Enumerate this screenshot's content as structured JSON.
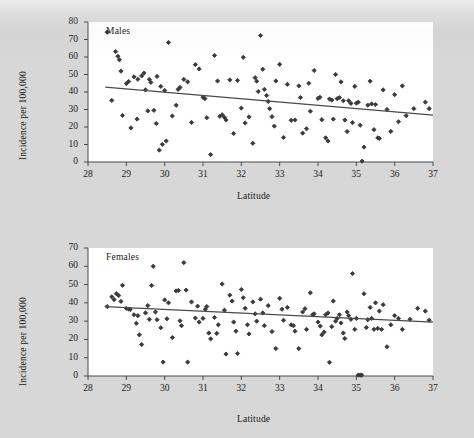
{
  "figure": {
    "background_color": "#d7d7d7",
    "plot_background_color": "#ffffff",
    "marker_color": "#3a3a3a",
    "line_color": "#4a4a4a",
    "axis_color": "#4a4a4a"
  },
  "chart_data": [
    {
      "type": "scatter",
      "title": "Males",
      "xlabel": "Latitude",
      "ylabel": "Incidence per 100,000",
      "xlim": [
        28,
        37
      ],
      "ylim": [
        0,
        80
      ],
      "xticks": [
        28,
        29,
        30,
        31,
        32,
        33,
        34,
        35,
        36,
        37
      ],
      "yticks": [
        0,
        10,
        20,
        30,
        40,
        50,
        60,
        70,
        80
      ],
      "grid": false,
      "legend": "none",
      "marker": "diamond",
      "trendline": {
        "x": [
          28.45,
          37.0
        ],
        "y": [
          42.8,
          26.8
        ],
        "label": "linear fit"
      },
      "points": [
        [
          28.5,
          74.2
        ],
        [
          28.62,
          35.2
        ],
        [
          28.72,
          63.1
        ],
        [
          28.78,
          60.4
        ],
        [
          28.82,
          58.4
        ],
        [
          28.86,
          51.9
        ],
        [
          28.9,
          26.6
        ],
        [
          29.0,
          44.8
        ],
        [
          29.06,
          46.0
        ],
        [
          29.12,
          19.5
        ],
        [
          29.2,
          48.7
        ],
        [
          29.28,
          24.5
        ],
        [
          29.3,
          47.3
        ],
        [
          29.4,
          49.2
        ],
        [
          29.46,
          50.8
        ],
        [
          29.5,
          41.2
        ],
        [
          29.56,
          29.2
        ],
        [
          29.6,
          47.2
        ],
        [
          29.64,
          45.5
        ],
        [
          29.72,
          29.5
        ],
        [
          29.78,
          22.0
        ],
        [
          29.8,
          48.9
        ],
        [
          29.86,
          6.8
        ],
        [
          29.9,
          43.2
        ],
        [
          29.94,
          10.1
        ],
        [
          30.0,
          40.9
        ],
        [
          30.04,
          12.0
        ],
        [
          30.1,
          68.3
        ],
        [
          30.2,
          26.3
        ],
        [
          30.3,
          32.4
        ],
        [
          30.35,
          41.5
        ],
        [
          30.4,
          42.6
        ],
        [
          30.5,
          47.2
        ],
        [
          30.6,
          45.8
        ],
        [
          30.7,
          22.6
        ],
        [
          30.8,
          55.6
        ],
        [
          30.9,
          53.2
        ],
        [
          31.0,
          37.0
        ],
        [
          31.05,
          36.2
        ],
        [
          31.1,
          25.3
        ],
        [
          31.2,
          4.2
        ],
        [
          31.3,
          60.9
        ],
        [
          31.38,
          46.3
        ],
        [
          31.44,
          26.1
        ],
        [
          31.5,
          27.0
        ],
        [
          31.56,
          25.5
        ],
        [
          31.6,
          24.0
        ],
        [
          31.7,
          46.9
        ],
        [
          31.8,
          16.3
        ],
        [
          31.9,
          46.6
        ],
        [
          32.0,
          30.8
        ],
        [
          32.05,
          59.8
        ],
        [
          32.1,
          22.3
        ],
        [
          32.2,
          25.8
        ],
        [
          32.3,
          10.7
        ],
        [
          32.36,
          48.2
        ],
        [
          32.4,
          46.2
        ],
        [
          32.44,
          40.3
        ],
        [
          32.5,
          72.3
        ],
        [
          32.56,
          53.0
        ],
        [
          32.6,
          41.5
        ],
        [
          32.66,
          38.0
        ],
        [
          32.7,
          34.6
        ],
        [
          32.74,
          30.5
        ],
        [
          32.8,
          25.9
        ],
        [
          32.86,
          20.5
        ],
        [
          32.9,
          46.3
        ],
        [
          33.0,
          55.8
        ],
        [
          33.1,
          14.0
        ],
        [
          33.2,
          44.4
        ],
        [
          33.3,
          23.8
        ],
        [
          33.4,
          24.0
        ],
        [
          33.5,
          43.5
        ],
        [
          33.54,
          36.8
        ],
        [
          33.6,
          16.5
        ],
        [
          33.7,
          19.0
        ],
        [
          33.76,
          45.0
        ],
        [
          33.8,
          29.0
        ],
        [
          33.9,
          52.3
        ],
        [
          34.0,
          36.3
        ],
        [
          34.05,
          37.0
        ],
        [
          34.1,
          24.2
        ],
        [
          34.2,
          13.8
        ],
        [
          34.26,
          12.0
        ],
        [
          34.3,
          36.0
        ],
        [
          34.36,
          35.4
        ],
        [
          34.4,
          24.5
        ],
        [
          34.46,
          50.0
        ],
        [
          34.5,
          36.2
        ],
        [
          34.56,
          36.8
        ],
        [
          34.6,
          45.8
        ],
        [
          34.66,
          35.0
        ],
        [
          34.7,
          24.0
        ],
        [
          34.76,
          17.4
        ],
        [
          34.8,
          35.0
        ],
        [
          34.86,
          33.5
        ],
        [
          34.9,
          22.5
        ],
        [
          34.96,
          43.2
        ],
        [
          35.0,
          33.6
        ],
        [
          35.05,
          34.2
        ],
        [
          35.1,
          21.0
        ],
        [
          35.15,
          0.5
        ],
        [
          35.2,
          8.5
        ],
        [
          35.3,
          32.5
        ],
        [
          35.36,
          46.2
        ],
        [
          35.4,
          33.2
        ],
        [
          35.46,
          18.5
        ],
        [
          35.5,
          32.8
        ],
        [
          35.56,
          13.8
        ],
        [
          35.6,
          13.5
        ],
        [
          35.7,
          41.2
        ],
        [
          35.8,
          30.0
        ],
        [
          35.9,
          17.5
        ],
        [
          36.0,
          38.5
        ],
        [
          36.1,
          23.0
        ],
        [
          36.2,
          43.5
        ],
        [
          36.3,
          26.5
        ],
        [
          36.5,
          30.5
        ],
        [
          36.8,
          34.2
        ],
        [
          36.9,
          30.5
        ]
      ]
    },
    {
      "type": "scatter",
      "title": "Females",
      "xlabel": "Latitude",
      "ylabel": "Incidence per 100,000",
      "xlim": [
        28,
        37
      ],
      "ylim": [
        0,
        70
      ],
      "xticks": [
        28,
        29,
        30,
        31,
        32,
        33,
        34,
        35,
        36,
        37
      ],
      "yticks": [
        0,
        10,
        20,
        30,
        40,
        50,
        60,
        70
      ],
      "grid": false,
      "legend": "none",
      "marker": "diamond",
      "trendline": {
        "x": [
          28.45,
          37.0
        ],
        "y": [
          37.9,
          29.5
        ],
        "label": "linear fit"
      },
      "points": [
        [
          28.5,
          38.0
        ],
        [
          28.62,
          43.3
        ],
        [
          28.68,
          41.8
        ],
        [
          28.74,
          45.0
        ],
        [
          28.8,
          44.0
        ],
        [
          28.86,
          40.8
        ],
        [
          28.9,
          49.6
        ],
        [
          29.0,
          37.0
        ],
        [
          29.06,
          36.6
        ],
        [
          29.1,
          36.4
        ],
        [
          29.2,
          33.5
        ],
        [
          29.26,
          28.8
        ],
        [
          29.3,
          33.0
        ],
        [
          29.34,
          22.5
        ],
        [
          29.4,
          17.2
        ],
        [
          29.5,
          34.5
        ],
        [
          29.56,
          38.5
        ],
        [
          29.6,
          31.0
        ],
        [
          29.66,
          49.5
        ],
        [
          29.7,
          60.0
        ],
        [
          29.76,
          35.0
        ],
        [
          29.8,
          30.8
        ],
        [
          29.9,
          26.4
        ],
        [
          29.96,
          7.6
        ],
        [
          30.0,
          41.6
        ],
        [
          30.06,
          31.3
        ],
        [
          30.1,
          40.0
        ],
        [
          30.2,
          21.0
        ],
        [
          30.3,
          46.5
        ],
        [
          30.36,
          46.8
        ],
        [
          30.4,
          30.2
        ],
        [
          30.44,
          27.5
        ],
        [
          30.5,
          62.0
        ],
        [
          30.56,
          47.0
        ],
        [
          30.6,
          7.6
        ],
        [
          30.7,
          40.5
        ],
        [
          30.8,
          31.7
        ],
        [
          30.86,
          38.2
        ],
        [
          30.9,
          29.5
        ],
        [
          31.0,
          31.5
        ],
        [
          31.06,
          36.5
        ],
        [
          31.1,
          38.0
        ],
        [
          31.15,
          23.5
        ],
        [
          31.2,
          20.3
        ],
        [
          31.3,
          32.0
        ],
        [
          31.36,
          23.3
        ],
        [
          31.4,
          28.0
        ],
        [
          31.5,
          50.3
        ],
        [
          31.56,
          36.0
        ],
        [
          31.6,
          12.0
        ],
        [
          31.7,
          44.2
        ],
        [
          31.76,
          41.0
        ],
        [
          31.8,
          29.5
        ],
        [
          31.86,
          24.5
        ],
        [
          31.9,
          12.3
        ],
        [
          32.0,
          47.3
        ],
        [
          32.05,
          42.8
        ],
        [
          32.1,
          37.0
        ],
        [
          32.16,
          28.0
        ],
        [
          32.2,
          23.0
        ],
        [
          32.3,
          40.5
        ],
        [
          32.36,
          34.0
        ],
        [
          32.4,
          30.0
        ],
        [
          32.5,
          42.0
        ],
        [
          32.56,
          34.5
        ],
        [
          32.6,
          27.5
        ],
        [
          32.7,
          38.5
        ],
        [
          32.8,
          24.3
        ],
        [
          32.9,
          15.0
        ],
        [
          33.0,
          42.5
        ],
        [
          33.06,
          36.5
        ],
        [
          33.1,
          30.5
        ],
        [
          33.2,
          37.5
        ],
        [
          33.3,
          28.0
        ],
        [
          33.36,
          27.5
        ],
        [
          33.4,
          24.5
        ],
        [
          33.5,
          15.0
        ],
        [
          33.6,
          35.0
        ],
        [
          33.66,
          36.8
        ],
        [
          33.7,
          25.5
        ],
        [
          33.8,
          45.5
        ],
        [
          33.86,
          33.5
        ],
        [
          33.9,
          34.0
        ],
        [
          34.0,
          29.5
        ],
        [
          34.06,
          27.3
        ],
        [
          34.1,
          22.5
        ],
        [
          34.16,
          24.0
        ],
        [
          34.2,
          33.5
        ],
        [
          34.26,
          34.5
        ],
        [
          34.3,
          7.5
        ],
        [
          34.36,
          27.0
        ],
        [
          34.4,
          41.0
        ],
        [
          34.46,
          30.0
        ],
        [
          34.5,
          31.5
        ],
        [
          34.56,
          33.5
        ],
        [
          34.6,
          29.0
        ],
        [
          34.66,
          23.5
        ],
        [
          34.7,
          20.5
        ],
        [
          34.76,
          35.0
        ],
        [
          34.8,
          33.0
        ],
        [
          34.86,
          31.0
        ],
        [
          34.9,
          56.0
        ],
        [
          34.96,
          25.5
        ],
        [
          35.0,
          31.5
        ],
        [
          35.05,
          0.5
        ],
        [
          35.1,
          0.5
        ],
        [
          35.14,
          0.5
        ],
        [
          35.2,
          45.0
        ],
        [
          35.26,
          26.5
        ],
        [
          35.3,
          30.8
        ],
        [
          35.36,
          37.5
        ],
        [
          35.4,
          31.5
        ],
        [
          35.46,
          25.5
        ],
        [
          35.5,
          40.0
        ],
        [
          35.56,
          26.0
        ],
        [
          35.6,
          35.5
        ],
        [
          35.66,
          25.5
        ],
        [
          35.7,
          39.0
        ],
        [
          35.8,
          16.0
        ],
        [
          35.9,
          28.0
        ],
        [
          36.0,
          33.0
        ],
        [
          36.1,
          31.5
        ],
        [
          36.2,
          25.5
        ],
        [
          36.4,
          31.0
        ],
        [
          36.6,
          37.0
        ],
        [
          36.8,
          35.5
        ],
        [
          36.9,
          30.5
        ]
      ]
    }
  ]
}
